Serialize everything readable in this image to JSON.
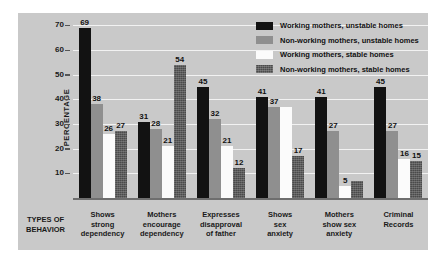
{
  "chart_data": {
    "type": "bar",
    "title": "",
    "xlabel": "TYPES OF BEHAVIOR",
    "ylabel": "PERCENTAGE",
    "ylim": [
      0,
      75
    ],
    "yticks": [
      10,
      20,
      30,
      40,
      50,
      60,
      70
    ],
    "grid": true,
    "legend_position": "top-right",
    "categories": [
      "Shows\nstrong\ndependency",
      "Mothers\nencourage\ndependency",
      "Expresses\ndisapproval\nof father",
      "Shows\nsex\nanxiety",
      "Mothers\nshow sex\nanxiety",
      "Criminal\nRecords"
    ],
    "category_lines": [
      [
        "Shows",
        "strong",
        "dependency"
      ],
      [
        "Mothers",
        "encourage",
        "dependency"
      ],
      [
        "Expresses",
        "disapproval",
        "of father"
      ],
      [
        "Shows",
        "sex",
        "anxiety"
      ],
      [
        "Mothers",
        "show sex",
        "anxiety"
      ],
      [
        "Criminal",
        "Records"
      ]
    ],
    "series": [
      {
        "name": "Working mothers, unstable homes",
        "color": "#121212",
        "values": [
          69,
          31,
          45,
          41,
          41,
          45
        ],
        "labels": [
          "69",
          "31",
          "45",
          "41",
          "41",
          "45"
        ]
      },
      {
        "name": "Non-working mothers, unstable homes",
        "color": "#8f8f8f",
        "values": [
          38,
          28,
          32,
          37,
          27,
          27
        ],
        "labels": [
          "38",
          "28",
          "32",
          "37",
          "27",
          "27"
        ]
      },
      {
        "name": "Working mothers, stable homes",
        "color": "#fbfbfb",
        "values": [
          26,
          21,
          21,
          37,
          5,
          16
        ],
        "labels": [
          "26",
          "21",
          "21",
          "",
          "5",
          "16"
        ]
      },
      {
        "name": "Non-working mothers, stable homes",
        "color": "#4a4a4a",
        "values": [
          27,
          54,
          12,
          17,
          7,
          15
        ],
        "labels": [
          "27",
          "54",
          "12",
          "17",
          "",
          "15"
        ]
      }
    ]
  },
  "axis": {
    "y_title": "PERCENTAGE",
    "x_title_lines": [
      "TYPES OF",
      "BEHAVIOR"
    ],
    "tick_labels": [
      "70",
      "60",
      "50",
      "40",
      "30",
      "20",
      "10"
    ]
  },
  "legend": {
    "items": [
      {
        "label": "Working mothers, unstable homes"
      },
      {
        "label": "Non-working mothers, unstable homes"
      },
      {
        "label": "Working mothers, stable homes"
      },
      {
        "label": "Non-working mothers, stable homes"
      }
    ]
  }
}
